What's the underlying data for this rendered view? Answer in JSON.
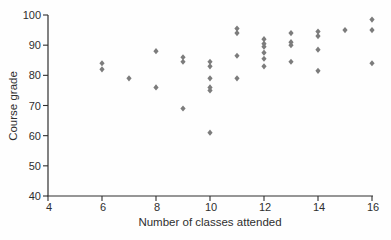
{
  "chart_data": {
    "type": "scatter",
    "title": "",
    "xlabel": "Number of classes attended",
    "ylabel": "Course grade",
    "xlim": [
      4,
      16
    ],
    "ylim": [
      40,
      100
    ],
    "x_ticks": [
      4,
      6,
      8,
      10,
      12,
      14,
      16
    ],
    "y_ticks": [
      40,
      50,
      60,
      70,
      80,
      90,
      100
    ],
    "grid": false,
    "legend": false,
    "marker": "diamond",
    "marker_color": "#7c7c7c",
    "axis_color": "#2e2e2e",
    "points": [
      [
        6,
        84
      ],
      [
        6,
        82
      ],
      [
        7,
        79
      ],
      [
        8,
        88
      ],
      [
        8,
        76
      ],
      [
        9,
        86
      ],
      [
        9,
        84.5
      ],
      [
        9,
        69
      ],
      [
        10,
        84.5
      ],
      [
        10,
        83
      ],
      [
        10,
        79
      ],
      [
        10,
        76
      ],
      [
        10,
        75
      ],
      [
        10,
        61
      ],
      [
        11,
        95.5
      ],
      [
        11,
        94
      ],
      [
        11,
        86.5
      ],
      [
        11,
        79
      ],
      [
        12,
        92
      ],
      [
        12,
        90.5
      ],
      [
        12,
        89.5
      ],
      [
        12,
        87.5
      ],
      [
        12,
        85.5
      ],
      [
        12,
        83
      ],
      [
        13,
        94
      ],
      [
        13,
        91
      ],
      [
        13,
        90
      ],
      [
        13,
        84.5
      ],
      [
        14,
        94.5
      ],
      [
        14,
        93
      ],
      [
        14,
        88.5
      ],
      [
        14,
        81.5
      ],
      [
        15,
        95
      ],
      [
        16,
        98.5
      ],
      [
        16,
        95
      ],
      [
        16,
        84
      ]
    ]
  }
}
